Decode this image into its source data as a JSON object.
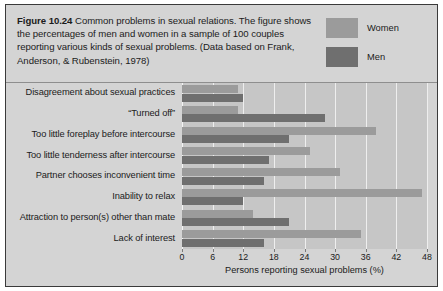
{
  "figure": {
    "number_label": "Figure 10.24",
    "caption_body": " Common problems in sexual relations. The figure shows the percentages of men and women in a sample of 100 couples reporting various kinds of sexual problems. (Data based on Frank, Anderson, & Rubenstein, 1978)"
  },
  "legend": {
    "position": "top-right",
    "entries": [
      {
        "label": "Women",
        "color": "#9b9b9b",
        "swatch_name": "legend-swatch-women"
      },
      {
        "label": "Men",
        "color": "#6f6f6f",
        "swatch_name": "legend-swatch-men"
      }
    ]
  },
  "colors": {
    "women": "#9b9b9b",
    "men": "#6f6f6f",
    "plot_background": "#c6c6c6",
    "card_background": "#d4d4d4",
    "gridline": "#eeeeee",
    "text": "#1b1b1b",
    "border": "#3a3a3a"
  },
  "chart_data": {
    "type": "bar",
    "orientation": "horizontal",
    "title": "",
    "xlabel": "Persons reporting sexual problems (%)",
    "ylabel": "",
    "xlim": [
      0,
      48
    ],
    "xticks": [
      0,
      6,
      12,
      18,
      24,
      30,
      36,
      42,
      48
    ],
    "xtick_labels": [
      "0",
      "6",
      "12",
      "18",
      "24",
      "30",
      "36",
      "42",
      "48"
    ],
    "grid": true,
    "grid_axis": "x",
    "legend_position": "top-right",
    "categories": [
      "Disagreement about sexual practices",
      "“Turned off”",
      "Too little foreplay before intercourse",
      "Too little tenderness after intercourse",
      "Partner chooses inconvenient time",
      "Inability to relax",
      "Attraction to person(s) other than mate",
      "Lack of interest"
    ],
    "series": [
      {
        "name": "Women",
        "color": "#9b9b9b",
        "values": [
          11,
          11,
          38,
          25,
          31,
          47,
          14,
          35
        ]
      },
      {
        "name": "Men",
        "color": "#6f6f6f",
        "values": [
          12,
          28,
          21,
          17,
          16,
          12,
          21,
          16
        ]
      }
    ]
  }
}
